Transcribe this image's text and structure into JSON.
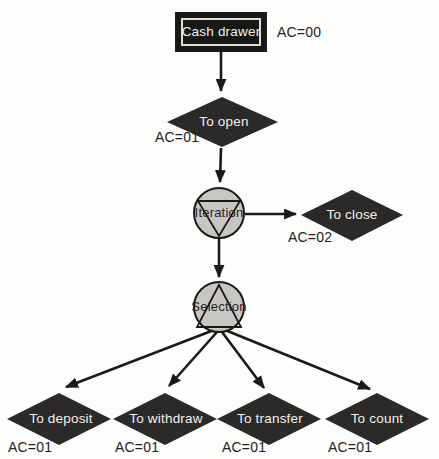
{
  "colors": {
    "background": "#fdfdfb",
    "node_fill": "#181816",
    "diamond_fill": "#2b2a28",
    "circle_fill": "#c8c6c2",
    "line": "#1b1a18",
    "text_on_dark": "#f1f0ed",
    "label_text": "#22211f"
  },
  "diagram": {
    "start_node": {
      "label": "Cash drawer",
      "ac": "AC=00"
    },
    "open_node": {
      "label": "To open",
      "ac": "AC=01"
    },
    "iteration_node": {
      "label": "Iteration"
    },
    "close_node": {
      "label": "To close",
      "ac": "AC=02"
    },
    "selection_node": {
      "label": "Selection"
    },
    "leaf_nodes": [
      {
        "label": "To deposit",
        "ac": "AC=01"
      },
      {
        "label": "To withdraw",
        "ac": "AC=01"
      },
      {
        "label": "To transfer",
        "ac": "AC=01"
      },
      {
        "label": "To count",
        "ac": "AC=01"
      }
    ]
  }
}
